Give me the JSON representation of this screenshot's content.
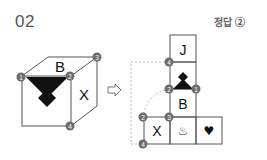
{
  "problem": {
    "number": "02",
    "answer_label": "정답 ②"
  },
  "cube": {
    "top_face_letter": "B",
    "right_face_letter": "X",
    "front_face_symbol": "black-down-triangle-diamond",
    "vertex_labels": [
      "1",
      "2",
      "3",
      "4"
    ]
  },
  "arrow": "⇨",
  "net": {
    "cells": [
      {
        "name": "J",
        "label": "J"
      },
      {
        "name": "triangle",
        "label": ""
      },
      {
        "name": "B",
        "label": "B"
      },
      {
        "name": "X",
        "label": "X"
      },
      {
        "name": "hot-spring",
        "label": "♨"
      },
      {
        "name": "heart",
        "label": "♥"
      }
    ],
    "vertex_labels": {
      "j_bottom_left": "4",
      "triangle_bottom_left": "2",
      "triangle_bottom_right": "1",
      "b_bottom_left": "3",
      "x_top_left": "2",
      "x_bottom_left": "4"
    }
  },
  "colors": {
    "line": "#555555",
    "circle": "#6b6b6b",
    "circle_text": "#ffffff",
    "fill_black": "#111111",
    "dashed": "#aaaaaa"
  }
}
